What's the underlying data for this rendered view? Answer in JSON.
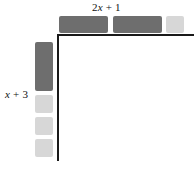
{
  "figure": {
    "type": "algebra-tile-area-model",
    "top_label": "2x + 1",
    "left_label": "x + 3",
    "colors": {
      "x_tile": "#6e6e6e",
      "unit_tile": "#d7d7d7",
      "axis": "#1a1a1a",
      "background": "#ffffff"
    },
    "top_edge": {
      "label": "2x + 1",
      "tiles": [
        {
          "kind": "x-tile",
          "shade": "dark"
        },
        {
          "kind": "x-tile",
          "shade": "dark"
        },
        {
          "kind": "unit-tile",
          "shade": "light"
        }
      ]
    },
    "left_edge": {
      "label": "x + 3",
      "tiles": [
        {
          "kind": "x-tile",
          "shade": "dark"
        },
        {
          "kind": "unit-tile",
          "shade": "light"
        },
        {
          "kind": "unit-tile",
          "shade": "light"
        },
        {
          "kind": "unit-tile",
          "shade": "light"
        }
      ]
    }
  }
}
